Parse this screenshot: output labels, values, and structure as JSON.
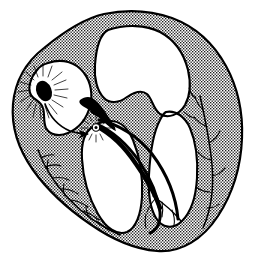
{
  "figure": {
    "style": "line-drawing-stippled",
    "background_color": "#ffffff",
    "ink_color": "#000000",
    "myocardium_tone": "#9a9a9a",
    "cavity_color": "#ffffff",
    "width": 255,
    "height": 275
  },
  "structures": {
    "myocardium": {
      "name": "myocardial-wall",
      "fill": "stipple",
      "outline_width": 2.1
    },
    "chambers": [
      {
        "id": "right-atrium",
        "name": "right-atrium-cavity",
        "fill": "#ffffff"
      },
      {
        "id": "left-atrium",
        "name": "left-atrium-cavity",
        "fill": "#ffffff"
      },
      {
        "id": "left-ventricle",
        "name": "left-ventricle-cavity",
        "fill": "#ffffff"
      },
      {
        "id": "right-ventricle",
        "name": "right-ventricle-cavity",
        "fill": "#ffffff"
      }
    ]
  },
  "conduction": {
    "sa_node": {
      "label": "sinoatrial-node",
      "shape": "filled-ellipse",
      "cx": 44,
      "cy": 91,
      "rx": 7.5,
      "ry": 10.5,
      "rotation": -22,
      "rays": 17,
      "color": "#000000"
    },
    "av_node": {
      "label": "atrioventricular-node",
      "shape": "filled-teardrop",
      "cx": 89,
      "cy": 109,
      "color": "#000000"
    },
    "his_origin_burst": {
      "label": "bundle-of-his-origin",
      "shape": "starburst-ring",
      "cx": 96,
      "cy": 127,
      "r": 3.4,
      "rays": 14
    },
    "internodal_arrow": {
      "label": "impulse-direction-arrow",
      "from": "sa-node",
      "to": "av-node"
    },
    "bundle_of_his": {
      "label": "bundle-of-his",
      "stroke_width": 4.4
    },
    "left_bundle_branch": {
      "label": "left-bundle-branch",
      "stroke_width": 3.0
    },
    "right_bundle_branch": {
      "label": "right-bundle-branch",
      "stroke_width": 3.0
    },
    "purkinje_network": {
      "label": "purkinje-fibers",
      "branch_count": 22,
      "stroke_width": 1.5
    }
  },
  "annotations": {
    "visible_text": []
  }
}
